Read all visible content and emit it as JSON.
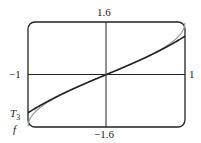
{
  "chart_data": {
    "type": "line",
    "title": "",
    "xlabel": "",
    "ylabel": "",
    "xlim": [
      -1,
      1
    ],
    "ylim": [
      -1.6,
      1.6
    ],
    "tick_labels": {
      "x_left": "-1",
      "x_right": "1",
      "y_top": "1.6",
      "y_bottom": "-1.6"
    },
    "series": [
      {
        "name": "f",
        "formula": "arcsin(x)",
        "color": "#999999",
        "x": [
          -1,
          -0.9,
          -0.75,
          -0.5,
          -0.25,
          0,
          0.25,
          0.5,
          0.75,
          0.9,
          1
        ],
        "y": [
          -1.571,
          -1.12,
          -0.848,
          -0.524,
          -0.253,
          0,
          0.253,
          0.524,
          0.848,
          1.12,
          1.571
        ]
      },
      {
        "name": "T3",
        "formula": "x + x^3/6",
        "color": "#222222",
        "x": [
          -1,
          -0.9,
          -0.75,
          -0.5,
          -0.25,
          0,
          0.25,
          0.5,
          0.75,
          0.9,
          1
        ],
        "y": [
          -1.167,
          -1.022,
          -0.82,
          -0.521,
          -0.253,
          0,
          0.253,
          0.521,
          0.82,
          1.022,
          1.167
        ]
      }
    ],
    "grid": false,
    "annotations": [
      {
        "text": "T3",
        "near": "left end of T3"
      },
      {
        "text": "f",
        "near": "left end of f"
      }
    ]
  },
  "labels": {
    "y_top": "1.6",
    "y_bottom": "−1.6",
    "x_left": "−1",
    "x_right": "1",
    "t3_main": "T",
    "t3_sub": "3",
    "f": "f"
  }
}
